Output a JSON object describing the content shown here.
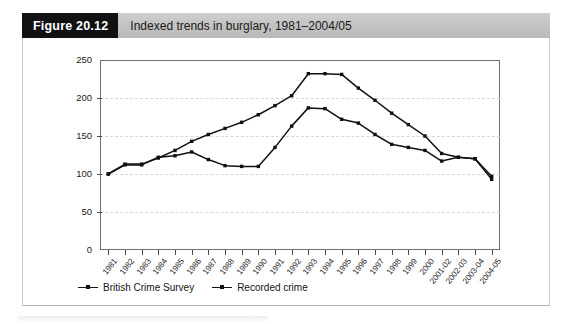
{
  "figure": {
    "number_label": "Figure 20.12",
    "caption": "Indexed trends in burglary, 1981–2004/05"
  },
  "colors": {
    "header_bar": "#c4c4c4",
    "number_box": "#111113",
    "plot_border": "#6f6f6f",
    "gridline": "#d8d8dc",
    "series_line": "#111111",
    "page_background": "#ffffff"
  },
  "legend": {
    "position": "bottom-left",
    "items": [
      {
        "label": "British Crime Survey",
        "marker": "line-with-square-marker"
      },
      {
        "label": "Recorded crime",
        "marker": "line-with-square-marker"
      }
    ]
  },
  "chart_data": {
    "type": "line",
    "title": "Indexed trends in burglary, 1981–2004/05",
    "xlabel": "",
    "ylabel": "",
    "ylim": [
      0,
      250
    ],
    "yticks": [
      0,
      50,
      100,
      150,
      200,
      250
    ],
    "grid": true,
    "grid_axis": "y",
    "legend_position": "bottom-left",
    "categories": [
      "1981",
      "1982",
      "1983",
      "1984",
      "1985",
      "1986",
      "1987",
      "1988",
      "1989",
      "1990",
      "1991",
      "1992",
      "1993",
      "1994",
      "1995",
      "1996",
      "1997",
      "1998",
      "1999",
      "2000",
      "2001-02",
      "2002-03",
      "2003-04",
      "2004-05"
    ],
    "series": [
      {
        "name": "British Crime Survey",
        "values": [
          100,
          112,
          112,
          122,
          124,
          129,
          119,
          111,
          110,
          110,
          135,
          163,
          187,
          186,
          172,
          167,
          152,
          139,
          135,
          131,
          117,
          122,
          120,
          93
        ]
      },
      {
        "name": "Recorded crime",
        "values": [
          100,
          113,
          113,
          121,
          131,
          143,
          152,
          160,
          168,
          178,
          190,
          203,
          232,
          232,
          231,
          213,
          197,
          180,
          165,
          150,
          127,
          122,
          120,
          97
        ]
      }
    ]
  }
}
